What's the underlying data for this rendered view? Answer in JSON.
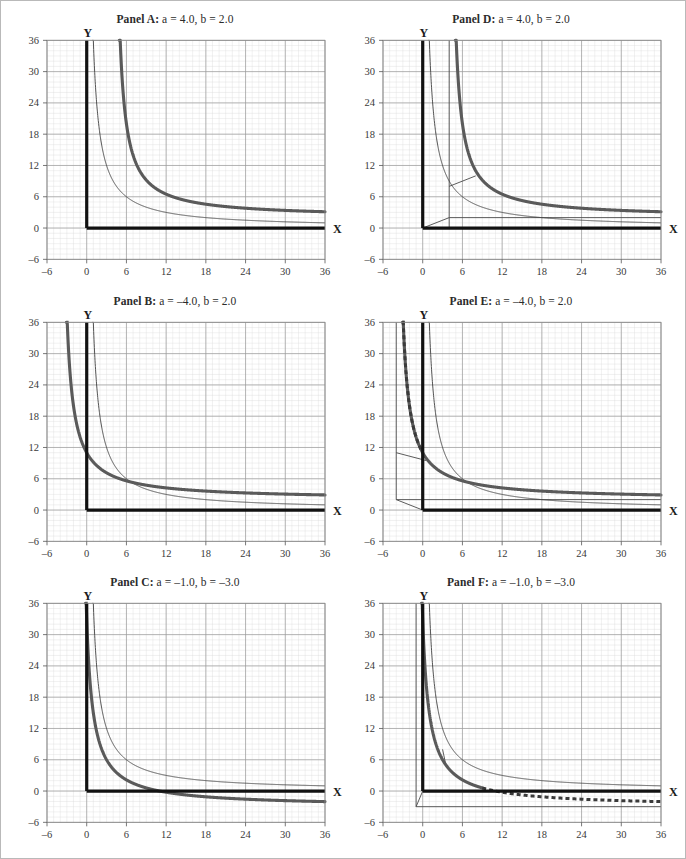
{
  "figure": {
    "border_color": "#b9b9b9",
    "background": "#ffffff",
    "panel_count": 6
  },
  "axis": {
    "x_label": "X",
    "y_label": "Y",
    "x_ticks": [
      "–6",
      "0",
      "6",
      "12",
      "18",
      "24",
      "30",
      "36"
    ],
    "y_ticks": [
      "36",
      "30",
      "24",
      "18",
      "12",
      "6",
      "0",
      "–6"
    ],
    "x_tick_values": [
      -6,
      0,
      6,
      12,
      18,
      24,
      30,
      36
    ],
    "y_tick_values": [
      36,
      30,
      24,
      18,
      12,
      6,
      0,
      -6
    ],
    "xlim": [
      -6,
      36
    ],
    "ylim": [
      -6,
      36
    ],
    "major_step": 6,
    "minor_step": 1,
    "grid": true,
    "major_grid_color": "#9a9a9a",
    "minor_grid_color": "#dcdcdc",
    "axis_color": "#111111"
  },
  "style": {
    "reference_curve_color": "#3d3d3d",
    "reference_curve_width": 0.9,
    "main_curve_color": "#5a5a5a",
    "main_curve_width": 3.1,
    "asymptote_color": "#4a4a4a",
    "asymptote_width": 0.9,
    "dashed_color": "#3a3a3a",
    "dashed_width": 3.0,
    "dash_pattern": "4 3"
  },
  "panels": [
    {
      "id": "A",
      "label": "Panel A:",
      "params_text": "a = 4.0, b = 2.0",
      "a": 4.0,
      "b": 2.0,
      "position": "top-left",
      "show_asymptotes": false,
      "show_dashed_branch": false,
      "title": "Panel A: a = 4.0, b = 2.0"
    },
    {
      "id": "D",
      "label": "Panel D:",
      "params_text": "a = 4.0, b = 2.0",
      "a": 4.0,
      "b": 2.0,
      "position": "top-right",
      "show_asymptotes": true,
      "show_dashed_branch": false,
      "title": "Panel D: a = 4.0, b = 2.0"
    },
    {
      "id": "B",
      "label": "Panel B:",
      "params_text": "a = –4.0, b = 2.0",
      "a": -4.0,
      "b": 2.0,
      "position": "middle-left",
      "show_asymptotes": false,
      "show_dashed_branch": false,
      "title": "Panel B: a = –4.0, b = 2.0"
    },
    {
      "id": "E",
      "label": "Panel E:",
      "params_text": "a = –4.0, b = 2.0",
      "a": -4.0,
      "b": 2.0,
      "position": "middle-right",
      "show_asymptotes": true,
      "show_dashed_branch": true,
      "title": "Panel E: a = –4.0, b = 2.0"
    },
    {
      "id": "C",
      "label": "Panel C:",
      "params_text": "a = –1.0, b = –3.0",
      "a": -1.0,
      "b": -3.0,
      "position": "bottom-left",
      "show_asymptotes": false,
      "show_dashed_branch": false,
      "title": "Panel C: a = –1.0, b = –3.0"
    },
    {
      "id": "F",
      "label": "Panel F:",
      "params_text": "a = –1.0, b = –3.0",
      "a": -1.0,
      "b": -3.0,
      "position": "bottom-right",
      "show_asymptotes": true,
      "show_dashed_branch": true,
      "title": "Panel F: a = –1.0, b = –3.0"
    }
  ],
  "chart_data": {
    "type": "line",
    "title": "",
    "xlabel": "X",
    "ylabel": "Y",
    "xlim": [
      -6,
      36
    ],
    "ylim": [
      -6,
      36
    ],
    "grid": true,
    "legend": "none",
    "shared_reference_series": {
      "name": "reference hyperbola y = 36/x",
      "formula": "y = 36 / x",
      "style": "thin solid",
      "points": [
        [
          1.0,
          36.0
        ],
        [
          1.5,
          24.0
        ],
        [
          2.0,
          18.0
        ],
        [
          3.0,
          12.0
        ],
        [
          4.0,
          9.0
        ],
        [
          6.0,
          6.0
        ],
        [
          9.0,
          4.0
        ],
        [
          12.0,
          3.0
        ],
        [
          18.0,
          2.0
        ],
        [
          24.0,
          1.5
        ],
        [
          30.0,
          1.2
        ],
        [
          36.0,
          1.0
        ]
      ]
    },
    "panels": [
      {
        "id": "A",
        "a": 4.0,
        "b": 2.0,
        "main_series": {
          "name": "y = 36/(x – a) + b, a = 4.0, b = 2.0",
          "formula": "y = 36/(x - 4) + 2",
          "style": "thick solid",
          "vertical_asymptote": 4.0,
          "horizontal_asymptote": 2.0,
          "points": [
            [
              5.0,
              38.0
            ],
            [
              5.2,
              32.0
            ],
            [
              5.5,
              26.0
            ],
            [
              6.0,
              20.0
            ],
            [
              7.0,
              14.0
            ],
            [
              8.0,
              11.0
            ],
            [
              10.0,
              8.0
            ],
            [
              12.0,
              6.5
            ],
            [
              16.0,
              5.0
            ],
            [
              20.0,
              4.25
            ],
            [
              24.0,
              3.8
            ],
            [
              30.0,
              3.38
            ],
            [
              36.0,
              3.13
            ]
          ]
        },
        "asymptote_lines": [],
        "dashed_series": null
      },
      {
        "id": "D",
        "a": 4.0,
        "b": 2.0,
        "main_series": {
          "name": "y = 36/(x – a) + b, a = 4.0, b = 2.0",
          "formula": "y = 36/(x - 4) + 2",
          "style": "thick solid",
          "vertical_asymptote": 4.0,
          "horizontal_asymptote": 2.0,
          "points": [
            [
              5.0,
              38.0
            ],
            [
              5.2,
              32.0
            ],
            [
              5.5,
              26.0
            ],
            [
              6.0,
              20.0
            ],
            [
              7.0,
              14.0
            ],
            [
              8.0,
              11.0
            ],
            [
              10.0,
              8.0
            ],
            [
              12.0,
              6.5
            ],
            [
              16.0,
              5.0
            ],
            [
              20.0,
              4.25
            ],
            [
              24.0,
              3.8
            ],
            [
              30.0,
              3.38
            ],
            [
              36.0,
              3.13
            ]
          ]
        },
        "asymptote_lines": [
          {
            "type": "vertical",
            "x": 4.0,
            "from_y": -0.2,
            "to_y": 36.0
          },
          {
            "type": "horizontal",
            "y": 2.0,
            "from_x": 4.0,
            "to_x": 36.0
          },
          {
            "type": "shift-vector",
            "from": [
              0.0,
              0.0
            ],
            "to": [
              4.0,
              2.0
            ]
          },
          {
            "type": "shift-vector",
            "from": [
              4.0,
              8.0
            ],
            "to": [
              8.0,
              10.0
            ]
          }
        ],
        "dashed_series": null
      },
      {
        "id": "B",
        "a": -4.0,
        "b": 2.0,
        "main_series": {
          "name": "y = 36/(x + 4) + 2, a = –4.0, b = 2.0",
          "formula": "y = 36/(x + 4) + 2",
          "style": "thick solid",
          "vertical_asymptote": -4.0,
          "horizontal_asymptote": 2.0,
          "points": [
            [
              0.0,
              11.0
            ],
            [
              1.0,
              9.2
            ],
            [
              2.0,
              8.0
            ],
            [
              3.0,
              7.14
            ],
            [
              4.0,
              6.5
            ],
            [
              6.0,
              5.6
            ],
            [
              8.0,
              5.0
            ],
            [
              12.0,
              4.25
            ],
            [
              16.0,
              3.8
            ],
            [
              20.0,
              3.5
            ],
            [
              24.0,
              3.29
            ],
            [
              30.0,
              3.06
            ],
            [
              36.0,
              2.9
            ]
          ]
        },
        "asymptote_lines": [],
        "dashed_series": null
      },
      {
        "id": "E",
        "a": -4.0,
        "b": 2.0,
        "main_series": {
          "name": "y = 36/(x + 4) + 2, a = –4.0, b = 2.0",
          "formula": "y = 36/(x + 4) + 2",
          "style": "thick solid",
          "vertical_asymptote": -4.0,
          "horizontal_asymptote": 2.0,
          "points": [
            [
              0.0,
              11.0
            ],
            [
              1.0,
              9.2
            ],
            [
              2.0,
              8.0
            ],
            [
              3.0,
              7.14
            ],
            [
              4.0,
              6.5
            ],
            [
              6.0,
              5.6
            ],
            [
              8.0,
              5.0
            ],
            [
              12.0,
              4.25
            ],
            [
              16.0,
              3.8
            ],
            [
              20.0,
              3.5
            ],
            [
              24.0,
              3.29
            ],
            [
              30.0,
              3.06
            ],
            [
              36.0,
              2.9
            ]
          ]
        },
        "asymptote_lines": [
          {
            "type": "vertical",
            "x": -4.0,
            "from_y": 2.0,
            "to_y": 36.0
          },
          {
            "type": "horizontal",
            "y": 2.0,
            "from_x": -4.0,
            "to_x": 36.0
          },
          {
            "type": "shift-vector",
            "from": [
              0.0,
              0.0
            ],
            "to": [
              -4.0,
              2.0
            ]
          },
          {
            "type": "shift-vector",
            "from": [
              -4.0,
              11.0
            ],
            "to": [
              0.5,
              9.5
            ]
          }
        ],
        "dashed_series": {
          "name": "dashed continuation left of Y axis",
          "style": "thick dashed",
          "points": [
            [
              -3.55,
              38.0
            ],
            [
              -3.6,
              32.0
            ],
            [
              -3.7,
              26.0
            ],
            [
              -3.8,
              22.0
            ],
            [
              -2.9,
              34.0
            ],
            [
              -2.6,
              28.0
            ],
            [
              -2.3,
              23.0
            ],
            [
              -2.0,
              20.0
            ],
            [
              -1.6,
              16.0
            ],
            [
              -1.2,
              14.0
            ],
            [
              -0.8,
              13.0
            ],
            [
              -0.4,
              12.0
            ],
            [
              0.0,
              11.0
            ]
          ]
        }
      },
      {
        "id": "C",
        "a": -1.0,
        "b": -3.0,
        "main_series": {
          "name": "y = 36/(x + 1) – 3, a = –1.0, b = –3.0",
          "formula": "y = 36/(x + 1) - 3",
          "style": "thick solid",
          "vertical_asymptote": -1.0,
          "horizontal_asymptote": -3.0,
          "points": [
            [
              0.0,
              33.0
            ],
            [
              0.2,
              27.0
            ],
            [
              0.5,
              21.0
            ],
            [
              0.8,
              17.0
            ],
            [
              1.0,
              15.0
            ],
            [
              1.5,
              11.4
            ],
            [
              2.0,
              9.0
            ],
            [
              3.0,
              6.0
            ],
            [
              4.0,
              4.2
            ],
            [
              5.0,
              3.0
            ],
            [
              7.0,
              1.5
            ],
            [
              9.0,
              0.6
            ],
            [
              12.0,
              -0.23
            ],
            [
              18.0,
              -1.1
            ],
            [
              24.0,
              -1.56
            ],
            [
              30.0,
              -1.84
            ],
            [
              36.0,
              -2.03
            ]
          ]
        },
        "asymptote_lines": [],
        "dashed_series": null
      },
      {
        "id": "F",
        "a": -1.0,
        "b": -3.0,
        "main_series": {
          "name": "y = 36/(x + 1) – 3, a = –1.0, b = –3.0",
          "formula": "y = 36/(x + 1) - 3",
          "style": "thick solid",
          "vertical_asymptote": -1.0,
          "horizontal_asymptote": -3.0,
          "points": [
            [
              0.0,
              33.0
            ],
            [
              0.2,
              27.0
            ],
            [
              0.5,
              21.0
            ],
            [
              0.8,
              17.0
            ],
            [
              1.0,
              15.0
            ],
            [
              1.5,
              11.4
            ],
            [
              2.0,
              9.0
            ],
            [
              3.0,
              6.0
            ],
            [
              4.0,
              4.2
            ],
            [
              5.0,
              3.0
            ],
            [
              7.0,
              1.5
            ],
            [
              9.0,
              0.6
            ]
          ]
        },
        "asymptote_lines": [
          {
            "type": "vertical",
            "x": -1.0,
            "from_y": -3.0,
            "to_y": 36.0
          },
          {
            "type": "horizontal",
            "y": -3.0,
            "from_x": -1.0,
            "to_x": 36.0
          },
          {
            "type": "shift-vector",
            "from": [
              0.0,
              0.0
            ],
            "to": [
              -1.0,
              -3.0
            ]
          },
          {
            "type": "shift-vector",
            "from": [
              3.0,
              8.0
            ],
            "to": [
              3.5,
              5.0
            ]
          }
        ],
        "dashed_series": {
          "name": "dashed continuation below X axis",
          "style": "thick dashed",
          "points": [
            [
              9.0,
              0.6
            ],
            [
              10.0,
              0.27
            ],
            [
              12.0,
              -0.23
            ],
            [
              14.0,
              -0.6
            ],
            [
              16.0,
              -0.88
            ],
            [
              18.0,
              -1.1
            ],
            [
              21.0,
              -1.36
            ],
            [
              24.0,
              -1.56
            ],
            [
              27.0,
              -1.71
            ],
            [
              30.0,
              -1.84
            ],
            [
              33.0,
              -1.94
            ],
            [
              36.0,
              -2.03
            ]
          ]
        }
      }
    ]
  }
}
